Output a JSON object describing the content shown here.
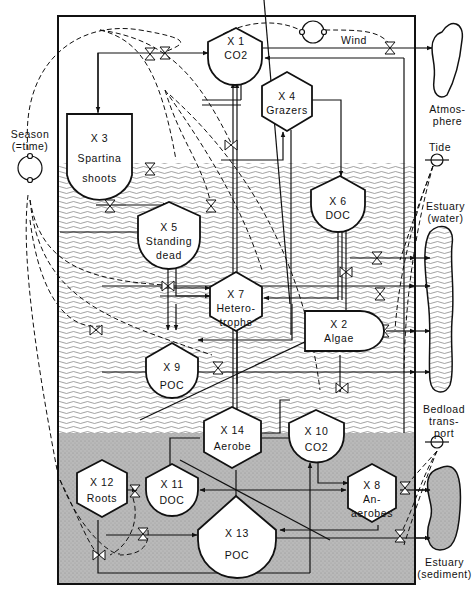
{
  "diagram": {
    "type": "estuarine salt-marsh ecosystem energy/material flow model",
    "colors": {
      "line": "#111111",
      "water_wave": "#8a8a8a",
      "sediment": "#b5b5b5",
      "node_fill": "#ffffff"
    },
    "zones": {
      "atmosphere": "Atmosphere",
      "water": "Estuary (water)",
      "sediment": "Estuary (sediment)"
    },
    "external_sources": {
      "season": {
        "line1": "Season",
        "line2": "(=time)"
      },
      "wind": "Wind",
      "tide": "Tide",
      "bedload": {
        "line1": "Bedload",
        "line2": "trans-",
        "line3": "port"
      }
    },
    "external_sinks": {
      "atmosphere": {
        "line1": "Atmos-",
        "line2": "phere"
      },
      "estuary_water": {
        "line1": "Estuary",
        "line2": "(water)"
      },
      "estuary_sediment": {
        "line1": "Estuary",
        "line2": "(sediment)"
      }
    },
    "nodes": [
      {
        "id": "X1",
        "label": "X 1",
        "name": "CO2",
        "shape": "storage-tank"
      },
      {
        "id": "X2",
        "label": "X 2",
        "name": "Algae",
        "shape": "producer"
      },
      {
        "id": "X3",
        "label": "X 3",
        "name_line1": "Spartina",
        "name_line2": "shoots",
        "shape": "producer"
      },
      {
        "id": "X4",
        "label": "X 4",
        "name": "Grazers",
        "shape": "consumer-hexagon"
      },
      {
        "id": "X5",
        "label": "X 5",
        "name_line1": "Standing",
        "name_line2": "dead",
        "shape": "storage-tank"
      },
      {
        "id": "X6",
        "label": "X 6",
        "name": "DOC",
        "shape": "storage-tank"
      },
      {
        "id": "X7",
        "label": "X 7",
        "name_line1": "Hetero-",
        "name_line2": "trophs",
        "shape": "consumer-hexagon"
      },
      {
        "id": "X8",
        "label": "X 8",
        "name_line1": "An-",
        "name_line2": "aerobes",
        "shape": "consumer-hexagon"
      },
      {
        "id": "X9",
        "label": "X 9",
        "name": "POC",
        "shape": "storage-tank"
      },
      {
        "id": "X10",
        "label": "X 10",
        "name": "CO2",
        "shape": "storage-tank"
      },
      {
        "id": "X11",
        "label": "X 11",
        "name": "DOC",
        "shape": "storage-tank"
      },
      {
        "id": "X12",
        "label": "X 12",
        "name": "Roots",
        "shape": "consumer-hexagon"
      },
      {
        "id": "X13",
        "label": "X 13",
        "name": "POC",
        "shape": "storage-tank"
      },
      {
        "id": "X14",
        "label": "X 14",
        "name": "Aerobe",
        "shape": "consumer-hexagon"
      }
    ]
  }
}
